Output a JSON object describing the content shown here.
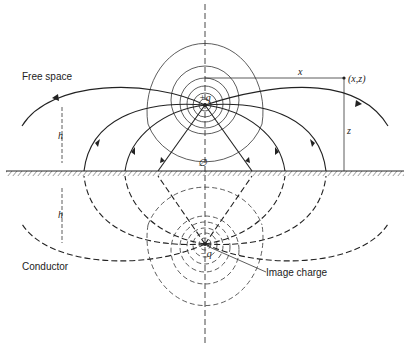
{
  "figure": {
    "labels": {
      "free_space": "Free space",
      "conductor": "Conductor",
      "image_charge": "Image charge",
      "positive_charge": "+q",
      "negative_charge": "−q",
      "origin": "∅",
      "point": "(x,z)",
      "x_dim": "x",
      "z_dim": "z",
      "h_upper": "h",
      "h_lower": "h"
    },
    "colors": {
      "ink": "#222222",
      "background": "#ffffff"
    }
  }
}
